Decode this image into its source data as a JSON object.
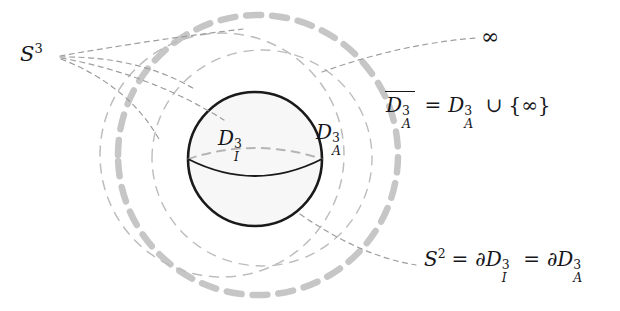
{
  "figure": {
    "type": "math-diagram",
    "caption_absent": true,
    "background": "#ffffff",
    "colors": {
      "sphere_outline": "#1a1a1a",
      "sphere_fill": "#f7f7f7",
      "thick_dashed_gray": "#c6c6c6",
      "thin_dashed_gray": "#b9b9b9",
      "leader_line": "#9a9a9a",
      "text": "#16161a"
    },
    "labels": {
      "s3": {
        "base": "S",
        "sup": "3",
        "x": 20,
        "y": 44
      },
      "d3_inner": {
        "base": "D",
        "sup": "3",
        "sub": "I",
        "x": 218,
        "y": 128
      },
      "d3_outer": {
        "base": "D",
        "sup": "3",
        "sub": "A",
        "x": 316,
        "y": 122
      },
      "infinity": {
        "glyph": "∞",
        "x": 483,
        "y": 25
      }
    },
    "equations": {
      "closure": {
        "text": "D̅A3 = DA3 ∪ {∞}",
        "parts": {
          "lhs_base": "D",
          "lhs_sup": "3",
          "lhs_sub": "A",
          "eq": "=",
          "rhs_base": "D",
          "rhs_sup": "3",
          "rhs_sub": "A",
          "cup": "∪",
          "lbrace": "{",
          "inf": "∞",
          "rbrace": "}"
        },
        "x": 386,
        "y": 95
      },
      "boundary": {
        "text": "S2 = ∂DI3 = ∂DA3",
        "parts": {
          "s": "S",
          "s_sup": "2",
          "eq1": "=",
          "d1_pd": "∂",
          "d1_base": "D",
          "d1_sup": "3",
          "d1_sub": "I",
          "eq2": "=",
          "d2_pd": "∂",
          "d2_base": "D",
          "d2_sup": "3",
          "d2_sub": "A"
        },
        "x": 424,
        "y": 248
      }
    },
    "shapes": {
      "sphere": {
        "cx": 255,
        "cy": 159,
        "r": 67
      },
      "equator_front": {
        "from_x": 188,
        "from_y": 159,
        "to_x": 322,
        "to_y": 159,
        "sag": 22
      },
      "equator_dashed": {
        "from_x": 188,
        "from_y": 159,
        "to_x": 322,
        "to_y": 159,
        "rise": 22
      },
      "outer_thick_circle": {
        "cx": 258,
        "cy": 155,
        "r": 140
      },
      "inner_thin_ellipse_left": {
        "cx": 222,
        "cy": 155,
        "rx": 122,
        "ry": 122
      },
      "inner_thin_ellipse_right": {
        "cx": 262,
        "cy": 158,
        "rx": 110,
        "ry": 108
      }
    }
  }
}
